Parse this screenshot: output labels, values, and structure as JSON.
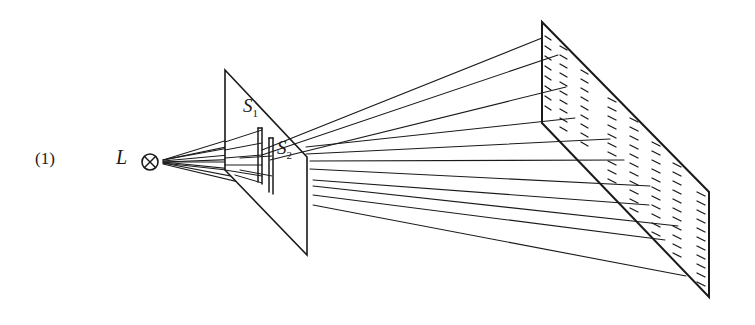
{
  "figure": {
    "number_label": "(1)",
    "source_label": "L",
    "source_symbol": "⊗",
    "slit1_label": "S",
    "slit1_sub": "1",
    "slit2_label": "S",
    "slit2_sub": "2"
  },
  "elements": {
    "source": "light-source L (circle with cross)",
    "barrier": "double-slit barrier plane with slits S1 and S2",
    "screen": "viewing screen with hatched interference fringes",
    "rays": "light rays from source through slits to screen"
  },
  "colors": {
    "ink": "#1a1a1a",
    "background": "#ffffff"
  }
}
